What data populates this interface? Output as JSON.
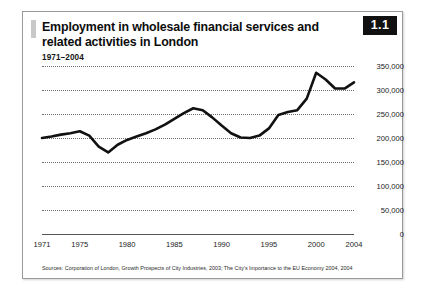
{
  "figure": {
    "number_badge": "1.1",
    "title": "Employment in wholesale financial services and related activities in London",
    "subtitle": "1971–2004",
    "source_note": "Sources: Corporation of London, Growth Prospects of City Industries, 2003; The City's Importance to the EU Economy 2004, 2004"
  },
  "chart_data": {
    "type": "line",
    "title": "Employment in wholesale financial services and related activities in London",
    "subtitle": "1971–2004",
    "xlabel": "",
    "ylabel": "",
    "xlim": [
      1971,
      2004
    ],
    "ylim": [
      0,
      350000
    ],
    "grid": true,
    "legend": false,
    "line_color": "#111111",
    "x_tick_labels": [
      "1971",
      "1975",
      "1980",
      "1985",
      "1990",
      "1995",
      "2000",
      "2004"
    ],
    "x_ticks": [
      1971,
      1975,
      1980,
      1985,
      1990,
      1995,
      2000,
      2004
    ],
    "y_tick_labels": [
      "0",
      "50,000",
      "100,000",
      "150,000",
      "200,000",
      "250,000",
      "300,000",
      "350,000"
    ],
    "y_ticks": [
      0,
      50000,
      100000,
      150000,
      200000,
      250000,
      300000,
      350000
    ],
    "x": [
      1971,
      1972,
      1973,
      1974,
      1975,
      1976,
      1977,
      1978,
      1979,
      1980,
      1981,
      1982,
      1983,
      1984,
      1985,
      1986,
      1987,
      1988,
      1989,
      1990,
      1991,
      1992,
      1993,
      1994,
      1995,
      1996,
      1997,
      1998,
      1999,
      2000,
      2001,
      2002,
      2003,
      2004
    ],
    "values": [
      200000,
      203000,
      207000,
      210000,
      214000,
      205000,
      182000,
      170000,
      186000,
      196000,
      203000,
      210000,
      218000,
      228000,
      240000,
      252000,
      262000,
      258000,
      243000,
      226000,
      210000,
      201000,
      200000,
      205000,
      220000,
      248000,
      254000,
      258000,
      282000,
      336000,
      322000,
      303000,
      303000,
      316000
    ],
    "series": [
      {
        "name": "Employment in wholesale financial services and related activities",
        "values": [
          200000,
          203000,
          207000,
          210000,
          214000,
          205000,
          182000,
          170000,
          186000,
          196000,
          203000,
          210000,
          218000,
          228000,
          240000,
          252000,
          262000,
          258000,
          243000,
          226000,
          210000,
          201000,
          200000,
          205000,
          220000,
          248000,
          254000,
          258000,
          282000,
          336000,
          322000,
          303000,
          303000,
          316000
        ]
      }
    ]
  }
}
